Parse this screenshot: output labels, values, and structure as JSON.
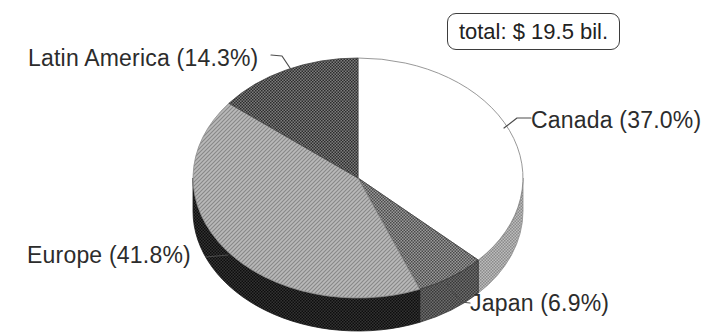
{
  "chart_data": {
    "type": "pie",
    "effect": "3d",
    "direction": "clockwise",
    "start_angle_deg": 0,
    "total_annotation": "total: $ 19.5 bil.",
    "total_value": "$ 19.5 bil.",
    "legend_position": "callout-labels",
    "slices": [
      {
        "id": "canada",
        "label": "Canada",
        "pct": 37.0,
        "display": "Canada (37.0%)",
        "face_pattern": "#ffffff",
        "rim_pattern": "pat-rim-light",
        "face_stroke": "#7d7d7d",
        "rim_stroke": "#8e8e8e"
      },
      {
        "id": "japan",
        "label": "Japan",
        "pct": 6.9,
        "display": "Japan (6.9%)",
        "face_pattern": "pat-face-mid",
        "rim_pattern": "pat-rim-mid",
        "face_stroke": "#3f3f3f",
        "rim_stroke": "#333333"
      },
      {
        "id": "europe",
        "label": "Europe",
        "pct": 41.8,
        "display": "Europe (41.8%)",
        "face_pattern": "pat-face-diag",
        "rim_pattern": "pat-rim-dark",
        "face_stroke": "#8c8c8c",
        "rim_stroke": "#151515"
      },
      {
        "id": "latin-america",
        "label": "Latin America",
        "pct": 14.3,
        "display": "Latin America (14.3%)",
        "face_pattern": "pat-face-dark",
        "rim_pattern": "pat-rim-mid",
        "face_stroke": "#3f3f3f",
        "rim_stroke": "#333333"
      }
    ],
    "colors": {
      "text": "#2c2c2c",
      "leader_line": "#4d4d4d",
      "annotation_border": "#3d3d3d",
      "face_light_hatch": "#b9b9b9",
      "face_mid_halftone": "#727272",
      "face_dark_halftone": "#545454",
      "rim_dark": "#202020",
      "rim_light": "#a3a3a3",
      "background": "#ffffff"
    }
  }
}
